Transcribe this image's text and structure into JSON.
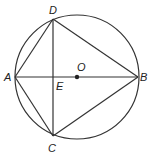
{
  "diagram": {
    "type": "circle-geometry",
    "circle": {
      "center": "O",
      "cx": 77,
      "cy": 77,
      "r": 62
    },
    "points": {
      "A": {
        "label": "A",
        "x": 15,
        "y": 77
      },
      "B": {
        "label": "B",
        "x": 138,
        "y": 77
      },
      "C": {
        "label": "C",
        "x": 53,
        "y": 136
      },
      "D": {
        "label": "D",
        "x": 53,
        "y": 19
      },
      "E": {
        "label": "E",
        "x": 53,
        "y": 77
      },
      "O": {
        "label": "O",
        "x": 77,
        "y": 77
      }
    },
    "segments": [
      "AD",
      "DB",
      "BC",
      "CA",
      "AB",
      "DC"
    ],
    "colors": {
      "stroke": "#333333",
      "background": "#ffffff"
    }
  }
}
